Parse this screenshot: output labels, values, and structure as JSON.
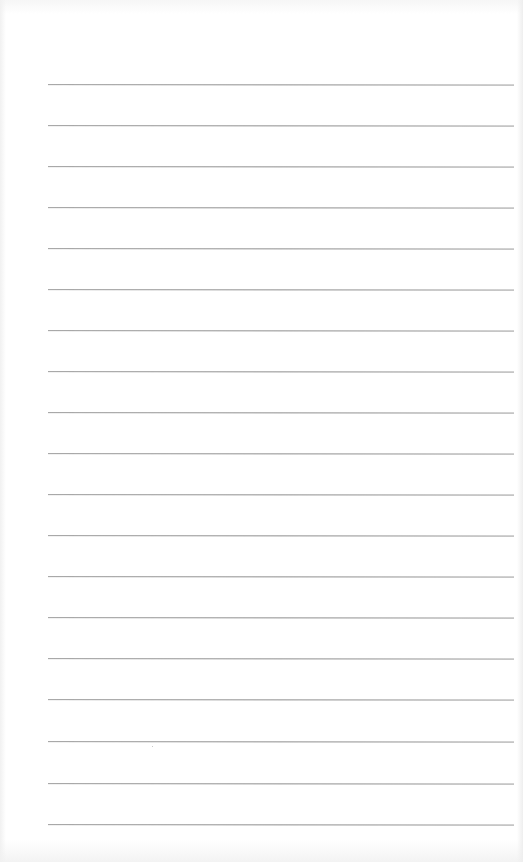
{
  "document": {
    "type": "ruled-paper",
    "background_color": "#ffffff",
    "line_color": "#a3a3a3",
    "rules": {
      "count": 19,
      "left_x": 48,
      "right_x": 514,
      "first_y": 84,
      "spacing": 41,
      "positions_y": [
        84,
        125,
        166,
        207,
        248,
        289,
        330,
        371,
        412,
        453,
        494,
        535,
        576,
        617,
        658,
        699,
        741,
        783,
        824
      ]
    },
    "text_content": []
  }
}
